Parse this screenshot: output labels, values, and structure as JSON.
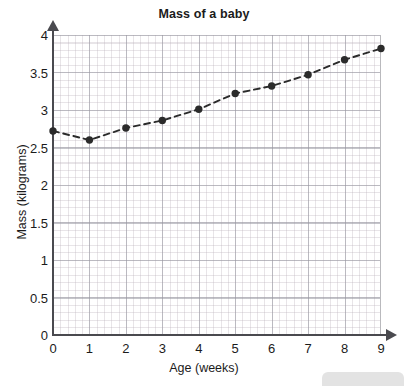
{
  "chart_data": {
    "type": "line",
    "title": "Mass of a baby",
    "xlabel": "Age (weeks)",
    "ylabel": "Mass (kilograms)",
    "x": [
      0,
      1,
      2,
      3,
      4,
      5,
      6,
      7,
      8,
      9
    ],
    "values": [
      2.72,
      2.6,
      2.76,
      2.86,
      3.01,
      3.22,
      3.32,
      3.47,
      3.67,
      3.82
    ],
    "series": [
      {
        "name": "Mass of a baby",
        "values": [
          2.72,
          2.6,
          2.76,
          2.86,
          3.01,
          3.22,
          3.32,
          3.47,
          3.67,
          3.82
        ]
      }
    ],
    "xlim": [
      0,
      9
    ],
    "ylim": [
      0,
      4
    ],
    "xticks": [
      "0",
      "1",
      "2",
      "3",
      "4",
      "5",
      "6",
      "7",
      "8",
      "9"
    ],
    "yticks": [
      "0",
      "0.5",
      "1",
      "1.5",
      "2",
      "2.5",
      "3",
      "3.5",
      "4"
    ],
    "grid": true,
    "minor_grid": true,
    "legend": "none",
    "line_style": "dashed",
    "marker": "filled-circle",
    "line_color": "#2b2b2b",
    "marker_color": "#2b2b2b",
    "grid_color": "#96969f",
    "minor_grid_color": "#b9afb9",
    "axis_color": "#4a4a4f"
  }
}
